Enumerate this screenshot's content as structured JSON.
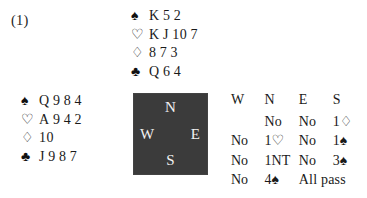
{
  "figure": {
    "label": "(1)"
  },
  "suits": {
    "spade": "♠",
    "heart": "♡",
    "diamond": "♢",
    "club": "♣"
  },
  "hands": {
    "north": {
      "position": "N",
      "rows": [
        {
          "suit_name": "spade-icon",
          "suit": "♠",
          "cards": "K 5 2"
        },
        {
          "suit_name": "heart-icon",
          "suit": "♡",
          "cards": "K J 10 7"
        },
        {
          "suit_name": "diamond-icon",
          "suit": "♢",
          "cards": "8 7 3"
        },
        {
          "suit_name": "club-icon",
          "suit": "♣",
          "cards": "Q 6 4"
        }
      ]
    },
    "west": {
      "position": "W",
      "rows": [
        {
          "suit_name": "spade-icon",
          "suit": "♠",
          "cards": "Q 9 8 4"
        },
        {
          "suit_name": "heart-icon",
          "suit": "♡",
          "cards": "A 9 4 2"
        },
        {
          "suit_name": "diamond-icon",
          "suit": "♢",
          "cards": "10"
        },
        {
          "suit_name": "club-icon",
          "suit": "♣",
          "cards": "J 9 8 7"
        }
      ]
    }
  },
  "compass": {
    "north": "N",
    "west": "W",
    "east": "E",
    "south": "S",
    "fill_color": "#3b3b3b",
    "text_color": "#f2f2f2"
  },
  "auction": {
    "headers": [
      "W",
      "N",
      "E",
      "S"
    ],
    "rows": [
      {
        "W": "",
        "N": "No",
        "E": "No",
        "S": "1♢"
      },
      {
        "W": "No",
        "N": "1♡",
        "E": "No",
        "S": "1♠"
      },
      {
        "W": "No",
        "N": "1NT",
        "E": "No",
        "S": "3♠"
      },
      {
        "W": "No",
        "N": "4♠",
        "E": "All pass",
        "S": ""
      }
    ]
  }
}
